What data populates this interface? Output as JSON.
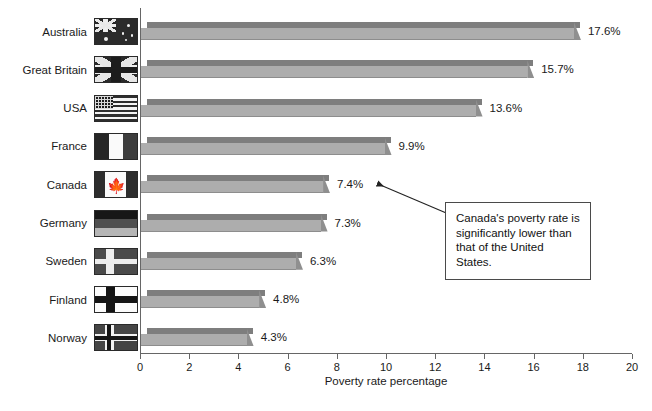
{
  "chart_data": {
    "type": "bar",
    "orientation": "horizontal",
    "title": "",
    "xlabel": "Poverty rate percentage",
    "ylabel": "",
    "xlim": [
      0,
      20
    ],
    "xticks": [
      0,
      2,
      4,
      6,
      8,
      10,
      12,
      14,
      16,
      18,
      20
    ],
    "grid": false,
    "legend": false,
    "categories": [
      "Australia",
      "Great Britain",
      "USA",
      "France",
      "Canada",
      "Germany",
      "Sweden",
      "Finland",
      "Norway"
    ],
    "values": [
      17.6,
      15.7,
      13.6,
      9.9,
      7.4,
      7.3,
      6.3,
      4.8,
      4.3
    ],
    "value_labels": [
      "17.6%",
      "15.7%",
      "13.6%",
      "9.9%",
      "7.4%",
      "7.3%",
      "6.3%",
      "4.8%",
      "4.3%"
    ],
    "annotations": [
      {
        "text": "Canada's poverty rate is significantly lower than that of the United States.",
        "points_to": "Canada"
      }
    ]
  },
  "axis": {
    "x_title": "Poverty rate percentage",
    "ticks": [
      "0",
      "2",
      "4",
      "6",
      "8",
      "10",
      "12",
      "14",
      "16",
      "18",
      "20"
    ]
  },
  "rows": [
    {
      "label": "Australia",
      "value_label": "17.6%",
      "value": 17.6,
      "flag": "flag-australia-icon"
    },
    {
      "label": "Great Britain",
      "value_label": "15.7%",
      "value": 15.7,
      "flag": "flag-great-britain-icon"
    },
    {
      "label": "USA",
      "value_label": "13.6%",
      "value": 13.6,
      "flag": "flag-usa-icon"
    },
    {
      "label": "France",
      "value_label": "9.9%",
      "value": 9.9,
      "flag": "flag-france-icon"
    },
    {
      "label": "Canada",
      "value_label": "7.4%",
      "value": 7.4,
      "flag": "flag-canada-icon"
    },
    {
      "label": "Germany",
      "value_label": "7.3%",
      "value": 7.3,
      "flag": "flag-germany-icon"
    },
    {
      "label": "Sweden",
      "value_label": "6.3%",
      "value": 6.3,
      "flag": "flag-sweden-icon"
    },
    {
      "label": "Finland",
      "value_label": "4.8%",
      "value": 4.8,
      "flag": "flag-finland-icon"
    },
    {
      "label": "Norway",
      "value_label": "4.3%",
      "value": 4.3,
      "flag": "flag-norway-icon"
    }
  ],
  "annotation": {
    "text": "Canada's poverty rate is significantly lower than that of the United States."
  },
  "colors": {
    "bar_front": "#adadad",
    "bar_top": "#7e7e7e",
    "bar_cap": "#8f8f8f",
    "axis": "#666666",
    "text": "#1a1a1a",
    "background": "#ffffff"
  }
}
